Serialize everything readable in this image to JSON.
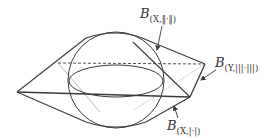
{
  "figure": {
    "colors": {
      "stroke": "#3a3a3a",
      "light_stroke": "#9a9a9a",
      "background": "#ffffff"
    },
    "labels": [
      {
        "id": "ball-x-norm",
        "main": "B",
        "subscript": "(X,‖·‖)"
      },
      {
        "id": "ball-y-norm",
        "main": "B",
        "subscript": "(Y,|||·|||)"
      },
      {
        "id": "ball-x-abs",
        "main": "B",
        "subscript": "(X,|·|)"
      }
    ]
  }
}
